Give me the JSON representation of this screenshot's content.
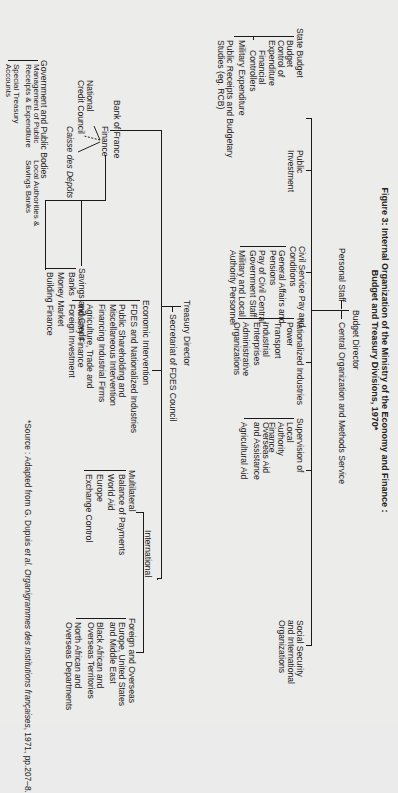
{
  "title": {
    "line1": "Figure 3: Internal Organization of the Ministry of the Economy and Finance :",
    "line2": "Budget and Treasury Divisions, 1970*"
  },
  "budget": {
    "director": "Budget Director",
    "personal_staff": "Personal Staff",
    "central_org": "Central Organization and Methods Service",
    "divisions": [
      {
        "label": "State Budget",
        "children": [
          "Budget",
          "Control of Expenditure",
          "Financial Controllers",
          "Military Expenditure",
          "Public Receipts and Budgetary Studies (eg. RCB)"
        ]
      },
      {
        "label": "Public Investment",
        "children": []
      },
      {
        "label": "Civil Service Pay and Conditions",
        "children": [
          "General Affairs and Pensions",
          "Pay of Civil Central Government Staff",
          "Military and Local Authority Personnel"
        ]
      },
      {
        "label": "Nationalized Industries",
        "children": [
          "Power",
          "Transport",
          "Industrial Enterprises",
          "Administrative Organizations"
        ]
      },
      {
        "label": "Supervision of",
        "children": [
          "Local Authority Finance",
          "Overseas Aid and Assistance",
          "Agricultural Aid"
        ]
      },
      {
        "label": "Social Security and International Organizations",
        "children": []
      }
    ]
  },
  "treasury": {
    "director": "Treasury Director",
    "secretariat": "Secretariat of FDES Council",
    "finance": {
      "label": "Finance",
      "linked": [
        "Bank of France",
        "National Credit Council",
        "Caisse des Dépôts"
      ],
      "government": {
        "label": "Government and Public Bodies",
        "children": [
          "Management of Public Receipts & Expenditure",
          "Local Authorities & Savings Banks",
          "Special Treasury Accounts"
        ]
      },
      "savings": {
        "label": "Savings and Credit",
        "children": [
          "Banks",
          "Money Market",
          "Building Finance"
        ]
      }
    },
    "economic": {
      "label": "Economic Intervention",
      "children": [
        "FDES and Nationalized Industries",
        "Public Shareholding and Miscellaneous Intervention",
        "Financing Industrial Firms",
        "Agriculture, Trade and Industry Finance",
        "Foreign Investment"
      ]
    },
    "international": {
      "label": "International",
      "multilateral": {
        "label": "Multilateral",
        "children": [
          "Balance of Payments",
          "World Aid",
          "Europe",
          "Exchange Control"
        ]
      },
      "foreign": {
        "label": "Foreign and Overseas",
        "children": [
          "Europe, United States and Middle East",
          "Black African and Overseas Territories",
          "North African and Overseas Departments"
        ]
      }
    }
  },
  "source": {
    "prefix": "*Source : Adapted from G. Dupuis ",
    "italic": "et al. Organigrammes des Institutions françaises",
    "suffix": ", 1971, pp.207–8."
  }
}
